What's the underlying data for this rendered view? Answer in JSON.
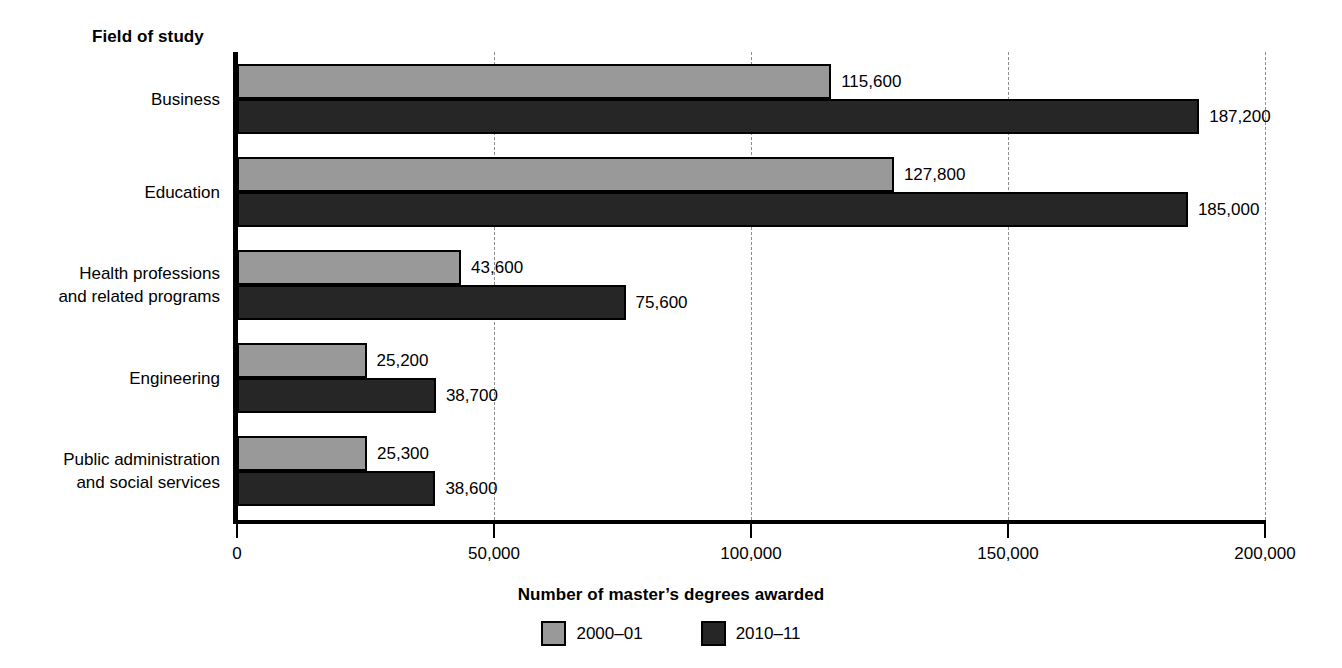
{
  "chart_data": {
    "type": "bar",
    "orientation": "horizontal",
    "title": "",
    "ylabel": "Field of study",
    "xlabel": "Number of master's degrees awarded",
    "categories": [
      "Business",
      "Education",
      "Health professions\nand related programs",
      "Engineering",
      "Public administration\nand social services"
    ],
    "series": [
      {
        "name": "2000-01",
        "color": "#999999",
        "values": [
          115600,
          127800,
          43600,
          25200,
          25300
        ],
        "value_labels": [
          "115,600",
          "127,800",
          "43,600",
          "25,200",
          "25,300"
        ]
      },
      {
        "name": "2010-11",
        "color": "#262626",
        "values": [
          187200,
          185000,
          75600,
          38700,
          38600
        ],
        "value_labels": [
          "187,200",
          "185,000",
          "75,600",
          "38,700",
          "38,600"
        ]
      }
    ],
    "xlim": [
      0,
      200000
    ],
    "xticks": [
      0,
      50000,
      100000,
      150000,
      200000
    ],
    "xtick_labels": [
      "0",
      "50,000",
      "100,000",
      "150,000",
      "200,000"
    ],
    "grid": "vertical-dashed",
    "legend_position": "bottom-center"
  },
  "legend": {
    "items": [
      {
        "label": "2000–01",
        "color": "#999999"
      },
      {
        "label": "2010–11",
        "color": "#262626"
      }
    ]
  },
  "axes": {
    "top_left_title": "Field of study",
    "bottom_title": "Number of master’s degrees awarded",
    "xtick_labels": [
      "0",
      "50,000",
      "100,000",
      "150,000",
      "200,000"
    ]
  },
  "category_labels": [
    "Business",
    "Education",
    "Health professions\nand related programs",
    "Engineering",
    "Public administration\nand social services"
  ],
  "value_labels": {
    "business_2000": "115,600",
    "business_2010": "187,200",
    "education_2000": "127,800",
    "education_2010": "185,000",
    "health_2000": "43,600",
    "health_2010": "75,600",
    "engineering_2000": "25,200",
    "engineering_2010": "38,700",
    "public_2000": "25,300",
    "public_2010": "38,600"
  }
}
